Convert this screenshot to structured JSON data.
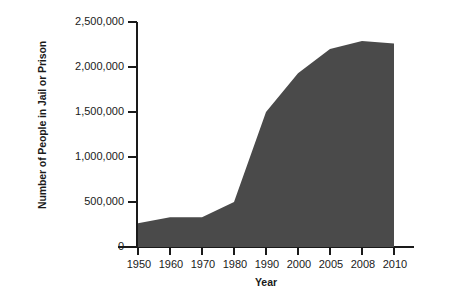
{
  "chart_data": {
    "type": "area",
    "title": "",
    "xlabel": "Year",
    "ylabel": "Number of People in Jail or Prison",
    "categories": [
      "1950",
      "1960",
      "1970",
      "1980",
      "1990",
      "2000",
      "2005",
      "2008",
      "2010"
    ],
    "values": [
      265000,
      330000,
      330000,
      500000,
      1500000,
      1930000,
      2200000,
      2290000,
      2260000
    ],
    "series": [
      {
        "name": "Number of People in Jail or Prison",
        "values": [
          265000,
          330000,
          330000,
          500000,
          1500000,
          1930000,
          2200000,
          2290000,
          2260000
        ]
      }
    ],
    "y_ticks": [
      0,
      500000,
      1000000,
      1500000,
      2000000,
      2500000
    ],
    "y_tick_labels": [
      "0",
      "500,000",
      "1,000,000",
      "1,500,000",
      "2,000,000",
      "2,500,000"
    ],
    "ylim": [
      0,
      2500000
    ],
    "grid": false,
    "legend": false,
    "fill_color": "#4a4a4a",
    "axis_color": "#1a1a1a",
    "background_color": "#ffffff"
  },
  "axes": {
    "x_title": "Year",
    "y_title": "Number of People in Jail or Prison"
  }
}
